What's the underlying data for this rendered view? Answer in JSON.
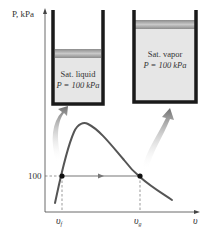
{
  "axes": {
    "y_label": "P, kPa",
    "x_label": "υ",
    "y_tick": "100",
    "x_ticks": [
      "υf",
      "υg"
    ],
    "x_tick_f_main": "υ",
    "x_tick_f_sub": "f",
    "x_tick_g_main": "υ",
    "x_tick_g_sub": "g"
  },
  "left_cylinder": {
    "line1": "Sat. liquid",
    "line2": "P = 100 kPa"
  },
  "right_cylinder": {
    "line1": "Sat. vapor",
    "line2": "P = 100 kPa"
  },
  "colors": {
    "curve": "#555555",
    "cylinder_wall": "#1a1a1a",
    "piston": "#9a9a9a",
    "fill": "#e6e6e6",
    "arrow": "#7a7a7a"
  }
}
